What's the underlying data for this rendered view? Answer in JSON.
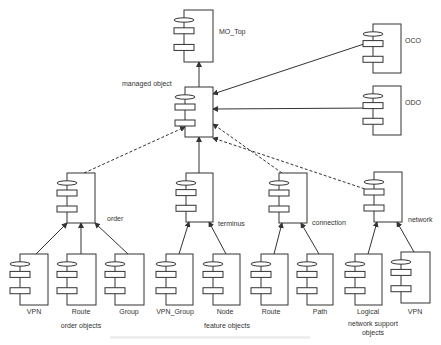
{
  "diagram": {
    "type": "component hierarchy",
    "nodes": [
      {
        "id": "mo_top",
        "label": "MO_Top",
        "x": 184,
        "y": 10,
        "w": 29,
        "h": 52,
        "label_x": 219,
        "label_y": 33
      },
      {
        "id": "managed",
        "label": "managed object",
        "x": 185,
        "y": 87,
        "w": 28,
        "h": 50,
        "label_x": 122,
        "label_y": 86
      },
      {
        "id": "oco",
        "label": "OCO",
        "x": 373,
        "y": 24,
        "w": 28,
        "h": 49,
        "label_x": 405,
        "label_y": 42
      },
      {
        "id": "odo",
        "label": "ODO",
        "x": 373,
        "y": 86,
        "w": 28,
        "h": 49,
        "label_x": 405,
        "label_y": 104
      },
      {
        "id": "order",
        "label": "order",
        "x": 67,
        "y": 173,
        "w": 28,
        "h": 50,
        "label_x": 107,
        "label_y": 221
      },
      {
        "id": "terminus",
        "label": "terminus",
        "x": 186,
        "y": 173,
        "w": 27,
        "h": 49,
        "label_x": 218,
        "label_y": 226
      },
      {
        "id": "connection",
        "label": "connection",
        "x": 279,
        "y": 173,
        "w": 28,
        "h": 50,
        "label_x": 312,
        "label_y": 225
      },
      {
        "id": "network",
        "label": "network",
        "x": 374,
        "y": 172,
        "w": 28,
        "h": 50,
        "label_x": 408,
        "label_y": 222
      },
      {
        "id": "vpn1",
        "label": "VPN",
        "x": 20,
        "y": 254,
        "w": 28,
        "h": 51
      },
      {
        "id": "route1",
        "label": "Route",
        "x": 67,
        "y": 254,
        "w": 29,
        "h": 51
      },
      {
        "id": "group",
        "label": "Group",
        "x": 115,
        "y": 254,
        "w": 29,
        "h": 51
      },
      {
        "id": "vpn_group",
        "label": "VPN_Group",
        "x": 166,
        "y": 254,
        "w": 27,
        "h": 51
      },
      {
        "id": "node",
        "label": "Node",
        "x": 213,
        "y": 254,
        "w": 27,
        "h": 51
      },
      {
        "id": "route2",
        "label": "Route",
        "x": 261,
        "y": 254,
        "w": 27,
        "h": 51
      },
      {
        "id": "path",
        "label": "Path",
        "x": 307,
        "y": 254,
        "w": 26,
        "h": 51
      },
      {
        "id": "logical",
        "label": "Logical",
        "x": 355,
        "y": 254,
        "w": 27,
        "h": 51
      },
      {
        "id": "vpn2",
        "label": "VPN",
        "x": 401,
        "y": 252,
        "w": 29,
        "h": 51
      }
    ],
    "edges": [
      {
        "from": "managed",
        "to": "mo_top",
        "style": "solid",
        "x1": 199,
        "y1": 87,
        "x2": 199,
        "y2": 62
      },
      {
        "from": "oco",
        "to": "managed",
        "style": "solid",
        "x1": 373,
        "y1": 41,
        "x2": 213,
        "y2": 94
      },
      {
        "from": "odo",
        "to": "managed",
        "style": "solid",
        "x1": 373,
        "y1": 108,
        "x2": 213,
        "y2": 109
      },
      {
        "from": "order",
        "to": "managed",
        "style": "dashed",
        "x1": 84,
        "y1": 173,
        "x2": 185,
        "y2": 127
      },
      {
        "from": "terminus",
        "to": "managed",
        "style": "solid",
        "x1": 199,
        "y1": 173,
        "x2": 199,
        "y2": 137
      },
      {
        "from": "connection",
        "to": "managed",
        "style": "dashed",
        "x1": 282,
        "y1": 173,
        "x2": 213,
        "y2": 124
      },
      {
        "from": "network",
        "to": "managed",
        "style": "dashed",
        "x1": 374,
        "y1": 192,
        "x2": 213,
        "y2": 138
      },
      {
        "from": "vpn1",
        "to": "order",
        "style": "solid",
        "x1": 36,
        "y1": 254,
        "x2": 67,
        "y2": 223
      },
      {
        "from": "route1",
        "to": "order",
        "style": "solid",
        "x1": 81,
        "y1": 254,
        "x2": 81,
        "y2": 223
      },
      {
        "from": "group",
        "to": "order",
        "style": "solid",
        "x1": 128,
        "y1": 254,
        "x2": 95,
        "y2": 223
      },
      {
        "from": "vpn_group",
        "to": "terminus",
        "style": "solid",
        "x1": 179,
        "y1": 254,
        "x2": 189,
        "y2": 222
      },
      {
        "from": "node",
        "to": "terminus",
        "style": "solid",
        "x1": 226,
        "y1": 254,
        "x2": 209,
        "y2": 222
      },
      {
        "from": "route2",
        "to": "connection",
        "style": "solid",
        "x1": 274,
        "y1": 254,
        "x2": 282,
        "y2": 223
      },
      {
        "from": "path",
        "to": "connection",
        "style": "solid",
        "x1": 319,
        "y1": 254,
        "x2": 301,
        "y2": 223
      },
      {
        "from": "logical",
        "to": "network",
        "style": "solid",
        "x1": 368,
        "y1": 254,
        "x2": 377,
        "y2": 222
      },
      {
        "from": "vpn2",
        "to": "network",
        "style": "solid",
        "x1": 414,
        "y1": 252,
        "x2": 397,
        "y2": 222
      }
    ],
    "group_labels": [
      {
        "text": "order objects",
        "x": 82,
        "y": 328
      },
      {
        "text": "feature objects",
        "x": 225,
        "y": 324
      },
      {
        "text": "network support objects",
        "x": 372,
        "y": 322
      }
    ]
  },
  "labels": {
    "mo_top": "MO_Top",
    "managed": "managed object",
    "oco": "OCO",
    "odo": "ODO",
    "order": "order",
    "terminus": "terminus",
    "connection": "connection",
    "network": "network",
    "vpn1": "VPN",
    "route1": "Route",
    "group": "Group",
    "vpn_group": "VPN_Group",
    "node": "Node",
    "route2": "Route",
    "path": "Path",
    "logical": "Logical",
    "vpn2": "VPN",
    "order_objects": "order objects",
    "feature_objects": "feature objects",
    "network_support_1": "network support",
    "network_support_2": "objects"
  }
}
